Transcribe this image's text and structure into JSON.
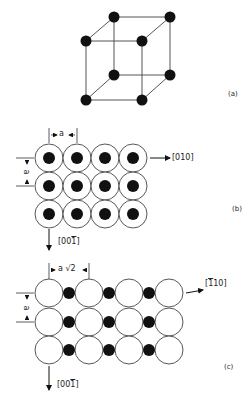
{
  "figure": {
    "panels": [
      {
        "id": "a",
        "label": "(a)",
        "description": "body-centered cubic unit cell corners"
      },
      {
        "id": "b",
        "label": "(b)",
        "spacing_label": "a",
        "vertical_spacing_label": "a",
        "direction_right": "[010]",
        "direction_right_parts": [
          "[0",
          "1",
          "0]"
        ],
        "direction_down": "[001̄]"
      },
      {
        "id": "c",
        "label": "(c)",
        "spacing_label": "a √2",
        "vertical_spacing_label": "a",
        "direction_right": "[1̄10]",
        "direction_down": "[001̄]"
      }
    ],
    "labels": {
      "a_panel": "(a)",
      "b_panel": "(b)",
      "c_panel": "(c)",
      "b_dim_h": "a",
      "b_dim_v": "a",
      "b_dir_right": "[010]",
      "b_dir_down_pre": "[00",
      "b_dir_down_bar": "1",
      "b_dir_down_post": "]",
      "c_dim_h": "a √2",
      "c_dim_v": "a",
      "c_dir_right_pre": "[",
      "c_dir_right_bar": "1",
      "c_dir_right_post": "10]",
      "c_dir_down_pre": "[00",
      "c_dir_down_bar": "1",
      "c_dir_down_post": "]"
    },
    "colors": {
      "ink": "#111111",
      "line": "#555555",
      "background": "#ffffff"
    }
  }
}
